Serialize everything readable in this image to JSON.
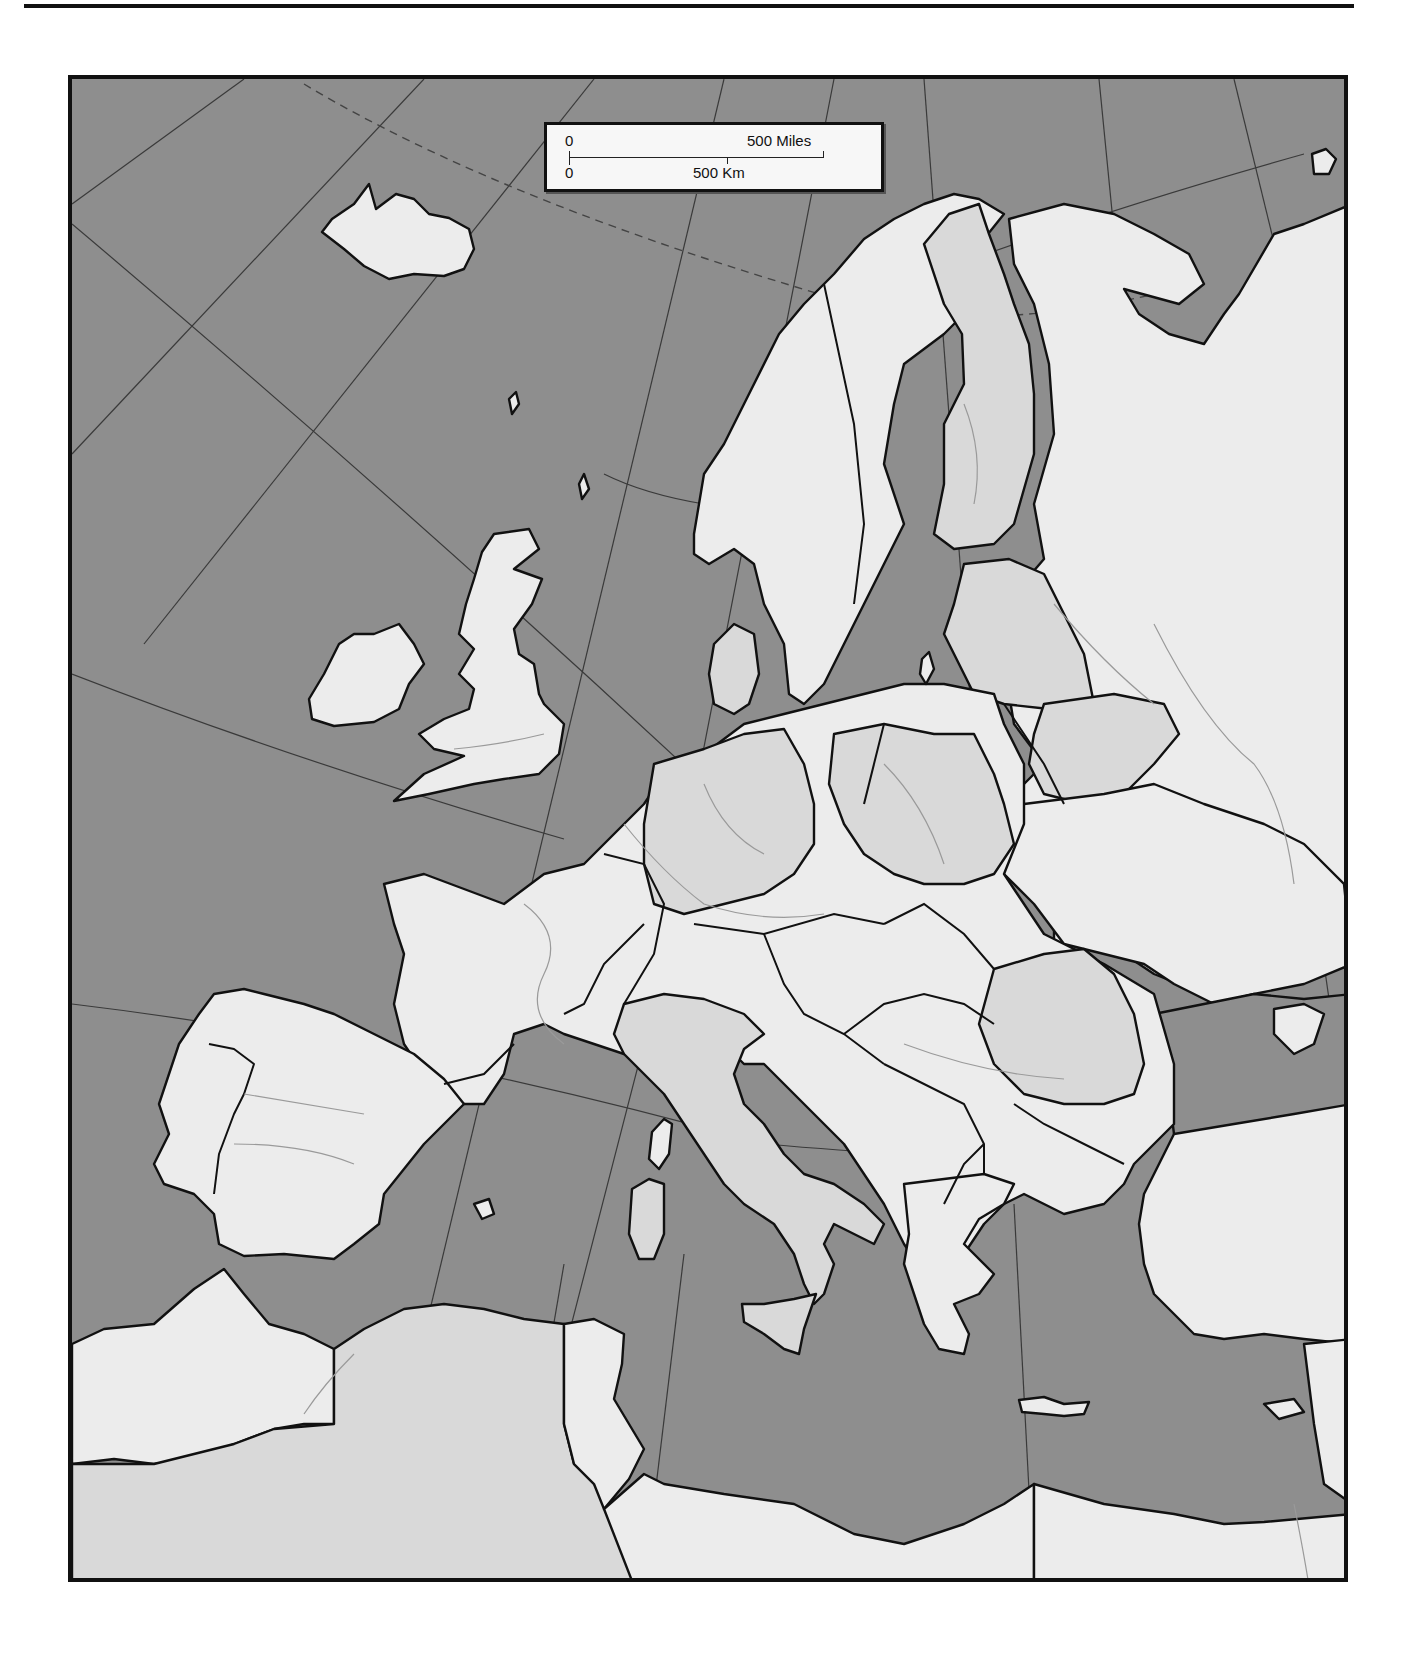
{
  "map": {
    "title": "Outline map of Europe",
    "colors": {
      "sea": "#8e8e8e",
      "land": "#ececec",
      "land_alt": "#d9d9d9",
      "border": "#111111",
      "river": "#9a9a9a",
      "graticule": "#3a3a3a"
    },
    "graticule": {
      "arctic_circle": "dashed"
    }
  },
  "scale_bar": {
    "miles_zero": "0",
    "miles_label": "500 Miles",
    "km_zero": "0",
    "km_label": "500 Km"
  }
}
